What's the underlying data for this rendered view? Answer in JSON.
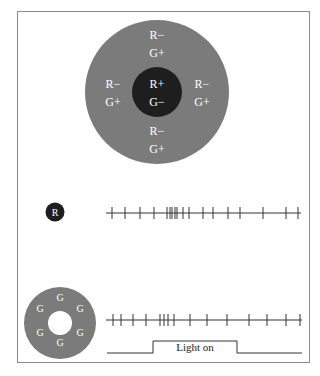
{
  "colors": {
    "frame": "#8a8a8a",
    "surround": "#7b7b7b",
    "center": "#1e1e1e",
    "label": "#ffffff",
    "line": "#333333",
    "background": "#ffffff"
  },
  "receptive_field": {
    "center_labels": [
      "R+",
      "G−"
    ],
    "surround_groups": [
      {
        "position": "top",
        "labels": [
          "R−",
          "G+"
        ]
      },
      {
        "position": "left",
        "labels": [
          "R−",
          "G+"
        ]
      },
      {
        "position": "right",
        "labels": [
          "R−",
          "G+"
        ]
      },
      {
        "position": "bottom",
        "labels": [
          "R−",
          "G+"
        ]
      }
    ]
  },
  "stimulus_red": {
    "label": "R",
    "spikes_x": [
      112,
      125,
      140,
      154,
      167,
      170,
      172,
      175,
      177,
      183,
      189,
      203,
      213,
      228,
      240,
      263,
      286,
      298
    ]
  },
  "stimulus_green": {
    "labels": [
      "G",
      "G",
      "G",
      "G",
      "G",
      "G"
    ],
    "spikes_x": [
      113,
      121,
      133,
      146,
      160,
      164,
      168,
      174,
      190,
      207,
      227,
      249,
      267,
      286,
      300
    ]
  },
  "light_indicator": {
    "label": "Light on",
    "on_start_x": 153,
    "on_end_x": 237
  }
}
